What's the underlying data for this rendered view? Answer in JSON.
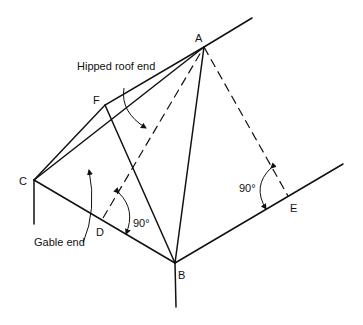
{
  "diagram": {
    "points": {
      "A": "A",
      "B": "B",
      "C": "C",
      "D": "D",
      "E": "E",
      "F": "F"
    },
    "annotations": {
      "hipped": "Hipped roof end",
      "gable": "Gable end",
      "angle_d": "90°",
      "angle_e": "90°"
    },
    "colors": {
      "line": "#111111",
      "background": "#ffffff"
    }
  }
}
